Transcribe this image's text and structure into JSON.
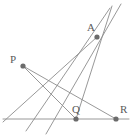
{
  "figure": {
    "type": "geometry-diagram",
    "width": 136,
    "height": 139,
    "background_color": "#ffffff",
    "stroke_color": "#8c8c8c",
    "dot_color": "#6b6b6b",
    "label_color": "#5a5a5a",
    "points": [
      {
        "id": "A",
        "label": "A",
        "x": 97,
        "y": 37,
        "label_x": 87,
        "label_y": 22
      },
      {
        "id": "P",
        "label": "P",
        "x": 23,
        "y": 66,
        "label_x": 10,
        "label_y": 54
      },
      {
        "id": "Q",
        "label": "Q",
        "x": 76,
        "y": 119,
        "label_x": 72,
        "label_y": 104
      },
      {
        "id": "R",
        "label": "R",
        "x": 116,
        "y": 119,
        "label_x": 120,
        "label_y": 104
      }
    ],
    "segments": [
      {
        "id": "baseline",
        "name": "horizontal-baseline",
        "x1": 3,
        "y1": 119,
        "x2": 129,
        "y2": 119
      },
      {
        "id": "PQ",
        "name": "line-P-to-Q",
        "x1": 23,
        "y1": 66,
        "x2": 76,
        "y2": 119
      },
      {
        "id": "PR",
        "name": "line-P-to-R",
        "x1": 23,
        "y1": 66,
        "x2": 116,
        "y2": 119
      },
      {
        "id": "A-left-low",
        "name": "line-through-A-to-lower-left",
        "x1": 110,
        "y1": 8,
        "x2": 26,
        "y2": 131
      },
      {
        "id": "A-left-steep",
        "name": "steep-line-through-A-to-bottom",
        "x1": 121,
        "y1": 4,
        "x2": 46,
        "y2": 134
      },
      {
        "id": "A-to-baseline-left",
        "name": "line-A-to-baseline-left-end",
        "x1": 97,
        "y1": 37,
        "x2": 3,
        "y2": 122
      },
      {
        "id": "QA-extended",
        "name": "line-Q-through-A-extended",
        "x1": 76,
        "y1": 119,
        "x2": 112,
        "y2": 6
      }
    ]
  }
}
